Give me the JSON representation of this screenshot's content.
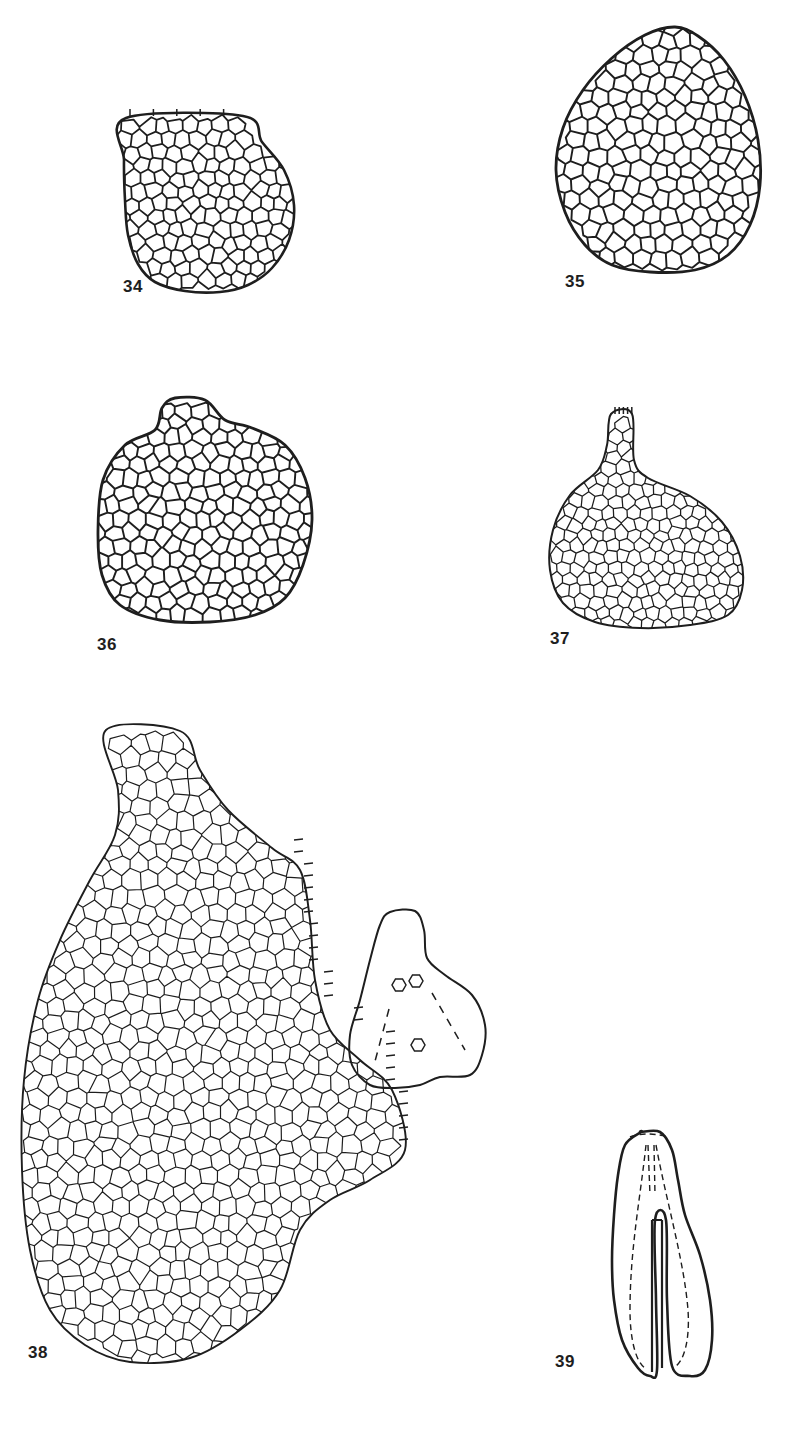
{
  "plate": {
    "width": 802,
    "height": 1431,
    "background": "#ffffff",
    "ink_color": "#1e1e1e"
  },
  "figures": [
    {
      "id": "34",
      "label": "34",
      "label_pos": [
        123,
        289
      ],
      "description": "Small ovate leaf, truncate apex with marginal teeth, areolation of isodiametric cells",
      "outline": [
        [
          126,
          118
        ],
        [
          243,
          116
        ],
        [
          262,
          142
        ],
        [
          284,
          170
        ],
        [
          294,
          205
        ],
        [
          289,
          240
        ],
        [
          272,
          268
        ],
        [
          248,
          285
        ],
        [
          220,
          292
        ],
        [
          185,
          291
        ],
        [
          155,
          282
        ],
        [
          138,
          264
        ],
        [
          128,
          235
        ],
        [
          125,
          200
        ],
        [
          124,
          160
        ]
      ],
      "cell_size": 15,
      "stroke": 2.2,
      "teeth_top": true
    },
    {
      "id": "35",
      "label": "35",
      "label_pos": [
        565,
        284
      ],
      "description": "Ovate leaf with rounded apex, uniform polygonal cell network",
      "outline": [
        [
          675,
          27
        ],
        [
          698,
          36
        ],
        [
          724,
          60
        ],
        [
          745,
          96
        ],
        [
          758,
          140
        ],
        [
          760,
          185
        ],
        [
          750,
          225
        ],
        [
          728,
          255
        ],
        [
          695,
          270
        ],
        [
          650,
          272
        ],
        [
          612,
          265
        ],
        [
          585,
          245
        ],
        [
          565,
          212
        ],
        [
          556,
          170
        ],
        [
          563,
          128
        ],
        [
          583,
          90
        ],
        [
          612,
          58
        ],
        [
          645,
          35
        ]
      ],
      "cell_size": 17,
      "stroke": 2.4
    },
    {
      "id": "36",
      "label": "36",
      "label_pos": [
        97,
        647
      ],
      "description": "Orbicular leaf with slight apical lobe, thick-walled cells",
      "outline": [
        [
          175,
          398
        ],
        [
          205,
          400
        ],
        [
          225,
          420
        ],
        [
          252,
          428
        ],
        [
          285,
          445
        ],
        [
          305,
          478
        ],
        [
          312,
          520
        ],
        [
          303,
          565
        ],
        [
          285,
          598
        ],
        [
          255,
          615
        ],
        [
          210,
          622
        ],
        [
          160,
          620
        ],
        [
          120,
          605
        ],
        [
          102,
          575
        ],
        [
          98,
          530
        ],
        [
          103,
          480
        ],
        [
          125,
          445
        ],
        [
          155,
          430
        ],
        [
          162,
          408
        ]
      ],
      "cell_size": 16,
      "stroke": 2.4
    },
    {
      "id": "37",
      "label": "37",
      "label_pos": [
        550,
        641
      ],
      "description": "Flask-shaped leaf with narrow apical neck and marginal teeth",
      "outline": [
        [
          611,
          414
        ],
        [
          632,
          414
        ],
        [
          634,
          460
        ],
        [
          648,
          478
        ],
        [
          690,
          496
        ],
        [
          722,
          522
        ],
        [
          740,
          556
        ],
        [
          742,
          590
        ],
        [
          728,
          615
        ],
        [
          690,
          625
        ],
        [
          640,
          628
        ],
        [
          595,
          622
        ],
        [
          563,
          603
        ],
        [
          550,
          570
        ],
        [
          553,
          530
        ],
        [
          570,
          495
        ],
        [
          598,
          470
        ],
        [
          607,
          445
        ]
      ],
      "cell_size": 13,
      "stroke": 1.6,
      "teeth_top": true
    },
    {
      "id": "38",
      "label": "38",
      "label_pos": [
        28,
        1355
      ],
      "description": "Large leaf with basal lobe and ciliate-toothed margin; areolation of elongate to isodiametric cells",
      "outline": [
        [
          106,
          730
        ],
        [
          180,
          731
        ],
        [
          200,
          770
        ],
        [
          228,
          810
        ],
        [
          272,
          848
        ],
        [
          300,
          870
        ],
        [
          310,
          920
        ],
        [
          315,
          980
        ],
        [
          330,
          1030
        ],
        [
          360,
          1060
        ],
        [
          392,
          1090
        ],
        [
          405,
          1150
        ],
        [
          370,
          1180
        ],
        [
          330,
          1200
        ],
        [
          300,
          1230
        ],
        [
          280,
          1290
        ],
        [
          240,
          1330
        ],
        [
          190,
          1358
        ],
        [
          130,
          1362
        ],
        [
          85,
          1345
        ],
        [
          50,
          1310
        ],
        [
          30,
          1250
        ],
        [
          22,
          1170
        ],
        [
          24,
          1080
        ],
        [
          38,
          1000
        ],
        [
          60,
          940
        ],
        [
          90,
          880
        ],
        [
          115,
          835
        ],
        [
          118,
          790
        ]
      ],
      "cell_size": 18,
      "stroke": 1.5,
      "teeth_right": true
    },
    {
      "id": "38-inset",
      "label": "",
      "description": "Leaf cross-section outline with three hexagonal cells and dashed veins",
      "outline": [
        [
          390,
          912
        ],
        [
          415,
          911
        ],
        [
          424,
          930
        ],
        [
          427,
          958
        ],
        [
          445,
          975
        ],
        [
          472,
          995
        ],
        [
          485,
          1025
        ],
        [
          482,
          1055
        ],
        [
          470,
          1075
        ],
        [
          440,
          1077
        ],
        [
          420,
          1085
        ],
        [
          395,
          1088
        ],
        [
          370,
          1085
        ],
        [
          352,
          1065
        ],
        [
          350,
          1035
        ],
        [
          360,
          1000
        ],
        [
          370,
          960
        ],
        [
          380,
          925
        ]
      ],
      "hexagons": [
        [
          399,
          985
        ],
        [
          416,
          981
        ],
        [
          418,
          1045
        ]
      ],
      "dashes": [
        [
          [
            389,
            1009
          ],
          [
            374,
            1065
          ]
        ],
        [
          [
            432,
            993
          ],
          [
            465,
            1050
          ]
        ]
      ]
    },
    {
      "id": "39",
      "label": "39",
      "label_pos": [
        555,
        1364
      ],
      "description": "Elongate bilobed leaf with median slit and dashed internal veins",
      "outline_left": [
        [
          641,
          1132
        ],
        [
          625,
          1145
        ],
        [
          618,
          1175
        ],
        [
          614,
          1215
        ],
        [
          612,
          1260
        ],
        [
          614,
          1300
        ],
        [
          622,
          1340
        ],
        [
          638,
          1368
        ],
        [
          650,
          1376
        ],
        [
          657,
          1370
        ],
        [
          656,
          1300
        ],
        [
          655,
          1220
        ]
      ],
      "outline_right": [
        [
          641,
          1132
        ],
        [
          660,
          1132
        ],
        [
          672,
          1150
        ],
        [
          678,
          1180
        ],
        [
          685,
          1215
        ],
        [
          700,
          1255
        ],
        [
          710,
          1300
        ],
        [
          712,
          1340
        ],
        [
          705,
          1370
        ],
        [
          690,
          1376
        ],
        [
          672,
          1366
        ],
        [
          667,
          1300
        ],
        [
          666,
          1220
        ],
        [
          655,
          1220
        ]
      ]
    }
  ],
  "labels": {
    "fig34": "34",
    "fig35": "35",
    "fig36": "36",
    "fig37": "37",
    "fig38": "38",
    "fig39": "39"
  }
}
